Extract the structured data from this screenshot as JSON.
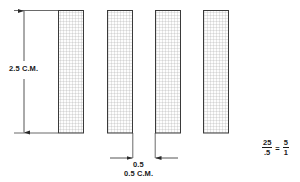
{
  "diagram": {
    "height_dimension": {
      "label": "2.5 C.M.",
      "value": 2.5,
      "unit": "C.M."
    },
    "gap_dimension": {
      "label_top": "0.5",
      "label_bottom": "0.5 C.M.",
      "value": 0.5,
      "unit": "C.M."
    },
    "ratio": {
      "numerator_left": "25",
      "denominator_left": ".5",
      "equals": "=",
      "numerator_right": "5",
      "denominator_right": "1"
    },
    "bars": [
      {
        "x": 58,
        "y": 10,
        "width": 25,
        "height": 123
      },
      {
        "x": 107,
        "y": 10,
        "width": 25,
        "height": 123
      },
      {
        "x": 155,
        "y": 10,
        "width": 25,
        "height": 123
      },
      {
        "x": 203,
        "y": 10,
        "width": 25,
        "height": 123
      }
    ],
    "colors": {
      "stroke": "#3a3a3a",
      "hatch": "#9a9a9a",
      "fill": "#fcfcfc",
      "text": "#1a1a1a",
      "dimension_line": "#2a2a2a"
    }
  }
}
